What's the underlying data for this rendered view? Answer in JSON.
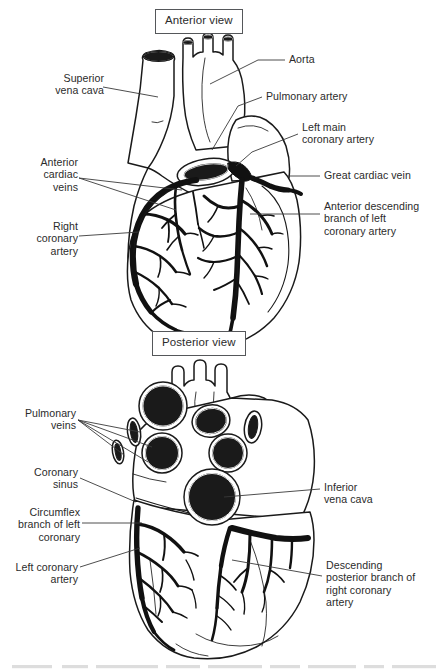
{
  "figure": {
    "style": "black and white line drawing"
  },
  "panels": [
    {
      "id": "anterior",
      "caption": "Anterior view"
    },
    {
      "id": "posterior",
      "caption": "Posterior view"
    }
  ],
  "anterior": {
    "caption": "Anterior view",
    "labels": {
      "superior_vena_cava": "Superior\nvena cava",
      "anterior_cardiac_veins": "Anterior\ncardiac\nveins",
      "right_coronary_artery": "Right\ncoronary\nartery",
      "aorta": "Aorta",
      "pulmonary_artery": "Pulmonary artery",
      "left_main_coronary_artery": "Left main\ncoronary artery",
      "great_cardiac_vein": "Great cardiac vein",
      "anterior_descending_branch": "Anterior descending\nbranch of left\ncoronary artery"
    }
  },
  "posterior": {
    "caption": "Posterior view",
    "labels": {
      "pulmonary_veins": "Pulmonary\nveins",
      "coronary_sinus": "Coronary\nsinus",
      "circumflex_branch": "Circumflex\nbranch of left\ncoronary",
      "left_coronary_artery": "Left coronary\nartery",
      "inferior_vena_cava": "Inferior\nvena cava",
      "descending_posterior_branch": "Descending\nposterior branch of\nright coronary\nartery"
    }
  },
  "colors": {
    "ink": "#000000",
    "text": "#2b2b2b",
    "box_border": "#55575a",
    "leader": "#3a3a3a",
    "vessel_fill": "#1a1a1a",
    "background": "#ffffff"
  }
}
